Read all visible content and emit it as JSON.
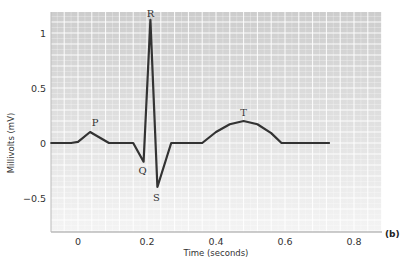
{
  "chart_data": {
    "type": "line",
    "title": "",
    "panel_label": "(b)",
    "xlabel": "Time (seconds)",
    "ylabel": "Millivolts (mV)",
    "xlim": [
      -0.08,
      0.88
    ],
    "ylim": [
      -0.8,
      1.2
    ],
    "x_ticks": [
      0,
      0.2,
      0.4,
      0.6,
      0.8
    ],
    "x_tick_labels": [
      "0",
      "0.2",
      "0.4",
      "0.6",
      "0.8"
    ],
    "y_ticks": [
      1,
      0.5,
      0,
      -0.5
    ],
    "y_tick_labels": [
      "1",
      "0.5",
      "0",
      "−0.5"
    ],
    "grid": true,
    "legend": null,
    "series": [
      {
        "name": "ECG",
        "color": "#333333",
        "x": [
          -0.08,
          -0.02,
          0.0,
          0.035,
          0.09,
          0.16,
          0.19,
          0.21,
          0.23,
          0.27,
          0.36,
          0.4,
          0.44,
          0.48,
          0.52,
          0.56,
          0.59,
          0.73
        ],
        "y": [
          0,
          0,
          0.01,
          0.1,
          0.0,
          0.0,
          -0.17,
          1.12,
          -0.4,
          0.0,
          0.0,
          0.1,
          0.17,
          0.2,
          0.17,
          0.09,
          0.0,
          0.0
        ]
      }
    ],
    "annotations": [
      {
        "text": "P",
        "x": 0.035,
        "y": 0.1
      },
      {
        "text": "Q",
        "x": 0.19,
        "y": -0.17
      },
      {
        "text": "R",
        "x": 0.21,
        "y": 1.12
      },
      {
        "text": "S",
        "x": 0.23,
        "y": -0.4
      },
      {
        "text": "T",
        "x": 0.48,
        "y": 0.2
      }
    ]
  }
}
